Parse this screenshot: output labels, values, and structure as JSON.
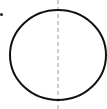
{
  "diagram": {
    "type": "circle-with-axis",
    "circle": {
      "cx": 58,
      "cy": 55,
      "rx": 48,
      "ry": 45,
      "stroke": "#111111",
      "stroke_width": 2
    },
    "axis": {
      "x": 58,
      "y1": 0,
      "y2": 109,
      "stroke": "#9a9a9a",
      "dash": "4,3"
    },
    "marker": {
      "x": 1.5,
      "y": 14.5,
      "r": 1.5,
      "fill": "#222222"
    }
  }
}
